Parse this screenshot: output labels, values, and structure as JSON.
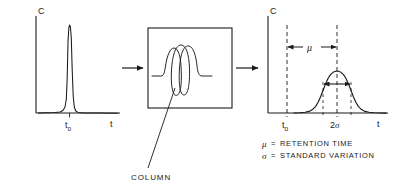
{
  "figure": {
    "stroke_color": "#1a1a1a",
    "background": "#ffffff"
  },
  "input_chart": {
    "name": "input-peak-chart",
    "y_axis_label": "C",
    "x_axis_label": "t",
    "peak_tick_label": "t",
    "peak_tick_sub": "o",
    "peak_description": "narrow sharp gaussian injection peak",
    "peak_center_t": 0.5,
    "peak_sigma": 0.022,
    "peak_height": 0.93
  },
  "column_box": {
    "name": "column-box",
    "label": "COLUMN",
    "description": "rectangular box containing a coiled tube with 2.5 loops"
  },
  "output_chart": {
    "name": "output-peak-chart",
    "y_axis_label": "C",
    "x_axis_label": "t",
    "origin_tick_label": "t",
    "origin_tick_sub": "o",
    "width_label_value": "2",
    "width_label_symbol": "σ",
    "mean_label": "μ",
    "peak_description": "broadened gaussian elution peak",
    "peak_center_t": 0.62,
    "peak_sigma": 0.105,
    "peak_height": 0.62
  },
  "arrows": {
    "connector_1": "arrow-right",
    "connector_2": "arrow-right",
    "mean_span": "double-headed-arrow",
    "width_span": "double-headed-arrow"
  },
  "legend": {
    "name": "legend",
    "entries": [
      {
        "symbol": "μ",
        "equals": "=",
        "text": "RETENTION TIME"
      },
      {
        "symbol": "σ",
        "equals": "=",
        "text": "STANDARD VARIATION"
      }
    ]
  }
}
